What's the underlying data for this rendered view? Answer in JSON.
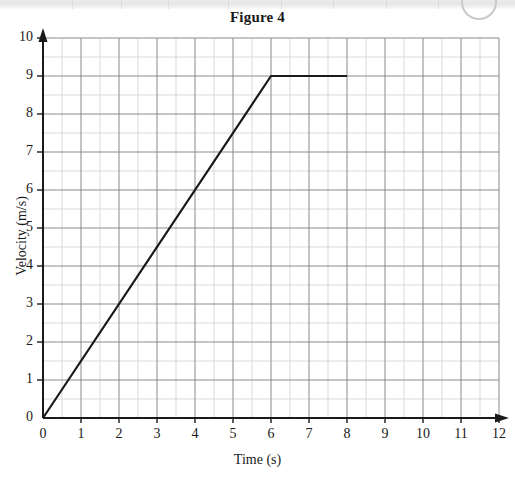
{
  "figure": {
    "title": "Figure 4"
  },
  "artifacts": {
    "scan_band_label": "scan-band",
    "scan_circle_label": "scan-mark"
  },
  "chart_data": {
    "type": "line",
    "title": "Figure 4",
    "xlabel": "Time (s)",
    "ylabel": "Velocity (m/s)",
    "xlim": [
      0,
      12
    ],
    "ylim": [
      0,
      10
    ],
    "xticks": [
      0,
      1,
      2,
      3,
      4,
      5,
      6,
      7,
      8,
      9,
      10,
      11,
      12
    ],
    "yticks": [
      0,
      1,
      2,
      3,
      4,
      5,
      6,
      7,
      8,
      9,
      10
    ],
    "xtick_labels": [
      "0",
      "1",
      "2",
      "3",
      "4",
      "5",
      "6",
      "7",
      "8",
      "9",
      "10",
      "11",
      "12"
    ],
    "ytick_labels": [
      "0",
      "1",
      "2",
      "3",
      "4",
      "5",
      "6",
      "7",
      "8",
      "9",
      "10"
    ],
    "minor_tick_step": 0.5,
    "grid": true,
    "grid_major_color": "#8a8a8a",
    "grid_minor_color": "#d9d9d9",
    "legend": null,
    "legend_position": "none",
    "series": [
      {
        "name": "Velocity",
        "color": "#1a1a1a",
        "x": [
          0,
          6,
          8
        ],
        "y": [
          0,
          9,
          9
        ],
        "points": [
          {
            "t": 0,
            "v": 0
          },
          {
            "t": 6,
            "v": 9
          },
          {
            "t": 8,
            "v": 9
          }
        ],
        "segments": [
          {
            "description": "uniform acceleration",
            "from_t": 0,
            "to_t": 6,
            "from_v": 0,
            "to_v": 9,
            "gradient": 1.5
          },
          {
            "description": "constant velocity",
            "from_t": 6,
            "to_t": 8,
            "from_v": 9,
            "to_v": 9,
            "gradient": 0
          }
        ]
      }
    ],
    "annotations": []
  }
}
